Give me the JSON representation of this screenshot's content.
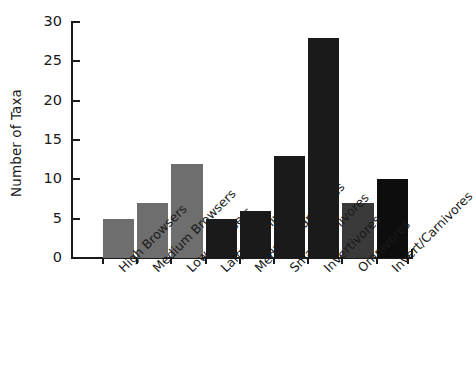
{
  "chart_data": {
    "type": "bar",
    "title": "",
    "subtitle": "",
    "xlabel": "",
    "ylabel": "Number of Taxa",
    "ylim": [
      0,
      30
    ],
    "ytick_values": [
      0,
      5,
      10,
      15,
      20,
      25,
      30
    ],
    "ytick_labels": [
      "0",
      "5",
      "10",
      "15",
      "20",
      "25",
      "30"
    ],
    "grid": false,
    "legend": null,
    "categories": [
      "High Browsers",
      "Medium Browsers",
      "Low Browsers",
      "Large Carnivores",
      "Medium Carnivores",
      "Small Carnivores",
      "Invertivores",
      "Omnivores",
      "Invert/Carnivores"
    ],
    "values": [
      5,
      7,
      12,
      5,
      6,
      13,
      28,
      7,
      10
    ],
    "bar_colors": [
      "#6e6e6e",
      "#6e6e6e",
      "#6e6e6e",
      "#1a1a1a",
      "#1a1a1a",
      "#1a1a1a",
      "#1a1a1a",
      "#3a3a3a",
      "#0d0d0d"
    ],
    "axis_color": "#1a1a1a",
    "background_color": "#ffffff"
  }
}
